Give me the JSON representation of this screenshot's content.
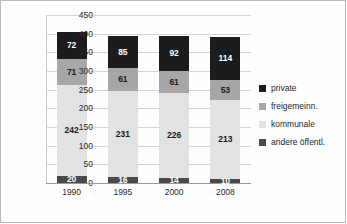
{
  "chart_data": {
    "type": "bar",
    "stacked": true,
    "title": "",
    "xlabel": "",
    "ylabel": "",
    "ylim": [
      0,
      450
    ],
    "ytick_step": 50,
    "yticks": [
      450,
      400,
      350,
      300,
      250,
      200,
      150,
      100,
      50,
      0
    ],
    "grid": true,
    "legend_position": "right",
    "categories": [
      "1990",
      "1995",
      "2000",
      "2008"
    ],
    "series": [
      {
        "name": "private",
        "color": "#1c1c1c",
        "values": [
          72,
          85,
          92,
          114
        ]
      },
      {
        "name": "freigemeinn.",
        "color": "#a6a6a6",
        "values": [
          71,
          61,
          61,
          53
        ]
      },
      {
        "name": "kommunale",
        "color": "#e2e2e2",
        "values": [
          242,
          231,
          226,
          213
        ]
      },
      {
        "name": "andere öffentl.",
        "color": "#4a4a4a",
        "values": [
          20,
          16,
          14,
          10
        ]
      }
    ],
    "stack_order_bottom_to_top": [
      "andere öffentl.",
      "kommunale",
      "freigemeinn.",
      "private"
    ],
    "totals": [
      405,
      393,
      393,
      390
    ]
  },
  "legend": {
    "items": [
      {
        "label": "private",
        "color": "#1c1c1c"
      },
      {
        "label": "freigemeinn.",
        "color": "#a6a6a6"
      },
      {
        "label": "kommunale",
        "color": "#e2e2e2"
      },
      {
        "label": "andere öffentl.",
        "color": "#4a4a4a"
      }
    ]
  }
}
